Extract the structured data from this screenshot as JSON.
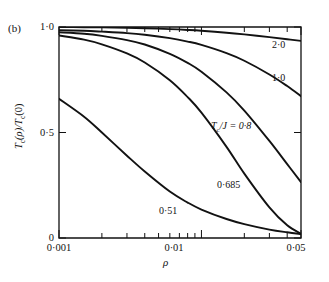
{
  "figure": {
    "panel_label": "(b)",
    "axis_color": "#121212",
    "curve_color": "#121212",
    "background": "#ffffff"
  },
  "axes": {
    "x": {
      "title": "ρ",
      "scale": "log",
      "range": [
        0.001,
        0.05
      ],
      "tick_labels": [
        "0·001",
        "0·01",
        "0·05"
      ],
      "tick_values": [
        0.001,
        0.01,
        0.05
      ],
      "minor_ticks": [
        0.002,
        0.003,
        0.004,
        0.005,
        0.006,
        0.007,
        0.008,
        0.009,
        0.02,
        0.03,
        0.04
      ]
    },
    "y": {
      "title_html": "T<sub>c</sub>(ρ)/T<sub>c</sub>(0)",
      "title_parts": {
        "t": "T",
        "c": "c",
        "rho": "(ρ)/",
        "t2": "T",
        "c2": "c",
        "zero": "(0)"
      },
      "scale": "linear",
      "range": [
        0,
        1
      ],
      "tick_labels": [
        "1·0",
        "0·5",
        "0"
      ],
      "tick_values": [
        1.0,
        0.5,
        0.0
      ]
    }
  },
  "curve_labels": {
    "c20": "2·0",
    "c10": "1·0",
    "c08_prefix": "T",
    "c08_sub": "c",
    "c08_suffix": "/J = 0·8",
    "c0685": "0·685",
    "c051": "0·51"
  },
  "chart_data": {
    "type": "line",
    "title": "",
    "subtitle": "",
    "panel": "(b)",
    "xlabel": "ρ",
    "ylabel": "T_c(ρ)/T_c(0)",
    "xscale": "log",
    "yscale": "linear",
    "xlim": [
      0.001,
      0.05
    ],
    "ylim": [
      0,
      1
    ],
    "xticks": [
      0.001,
      0.01,
      0.05
    ],
    "xticklabels": [
      "0·001",
      "0·01",
      "0·05"
    ],
    "yticks": [
      0,
      0.5,
      1.0
    ],
    "yticklabels": [
      "0",
      "0·5",
      "1·0"
    ],
    "grid": false,
    "legend": "inline-curve-labels",
    "series": [
      {
        "name": "2·0",
        "label": "2·0",
        "annotation_xy": [
          0.032,
          0.93
        ],
        "x": [
          0.001,
          0.0015,
          0.002,
          0.003,
          0.004,
          0.006,
          0.008,
          0.01,
          0.015,
          0.02,
          0.03,
          0.04,
          0.05
        ],
        "y": [
          1.0,
          0.999,
          0.998,
          0.996,
          0.994,
          0.99,
          0.986,
          0.982,
          0.973,
          0.965,
          0.952,
          0.942,
          0.934
        ]
      },
      {
        "name": "1·0",
        "label": "1·0",
        "annotation_xy": [
          0.032,
          0.78
        ],
        "x": [
          0.001,
          0.0015,
          0.002,
          0.003,
          0.004,
          0.006,
          0.008,
          0.01,
          0.015,
          0.02,
          0.03,
          0.04,
          0.05
        ],
        "y": [
          0.985,
          0.982,
          0.978,
          0.971,
          0.963,
          0.947,
          0.931,
          0.915,
          0.876,
          0.84,
          0.775,
          0.72,
          0.672
        ]
      },
      {
        "name": "T_c/J = 0·8",
        "label": "T_c/J = 0·8",
        "annotation_xy": [
          0.0075,
          0.555
        ],
        "x": [
          0.001,
          0.0015,
          0.002,
          0.003,
          0.004,
          0.006,
          0.008,
          0.01,
          0.015,
          0.02,
          0.03,
          0.04,
          0.05
        ],
        "y": [
          0.975,
          0.968,
          0.958,
          0.938,
          0.917,
          0.873,
          0.83,
          0.788,
          0.69,
          0.604,
          0.46,
          0.35,
          0.265
        ]
      },
      {
        "name": "0·685",
        "label": "0·685",
        "annotation_xy": [
          0.0088,
          0.27
        ],
        "x": [
          0.001,
          0.0015,
          0.002,
          0.003,
          0.004,
          0.006,
          0.008,
          0.01,
          0.015,
          0.02,
          0.03,
          0.04,
          0.05
        ],
        "y": [
          0.96,
          0.94,
          0.918,
          0.875,
          0.832,
          0.748,
          0.668,
          0.594,
          0.432,
          0.305,
          0.145,
          0.06,
          0.02
        ]
      },
      {
        "name": "0·51",
        "label": "0·51",
        "annotation_xy": [
          0.0042,
          0.13
        ],
        "x": [
          0.001,
          0.0015,
          0.002,
          0.003,
          0.004,
          0.006,
          0.008,
          0.01,
          0.015,
          0.02,
          0.03,
          0.04,
          0.05
        ],
        "y": [
          0.66,
          0.575,
          0.5,
          0.39,
          0.315,
          0.22,
          0.168,
          0.135,
          0.09,
          0.066,
          0.04,
          0.027,
          0.019
        ]
      }
    ]
  }
}
